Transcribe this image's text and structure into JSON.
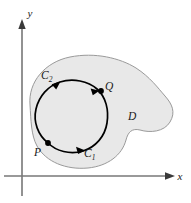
{
  "figure": {
    "background_color": "#ffffff",
    "region": {
      "label": "D",
      "fill_color": "#e8e8e8",
      "stroke_color": "#9a9a9a",
      "label_x": 128,
      "label_y": 119
    },
    "axes": {
      "color": "#777777",
      "x_label": "x",
      "y_label": "y",
      "x_label_pos": {
        "x": 178,
        "y": 180
      },
      "y_label_pos": {
        "x": 30,
        "y": 17
      },
      "origin": {
        "x": 22,
        "y": 176
      }
    },
    "curve": {
      "stroke_color": "#000000",
      "stroke_width": 1.6
    },
    "points": [
      {
        "name": "P",
        "label": "P",
        "x": 48,
        "y": 143,
        "label_x": 36,
        "label_y": 155
      },
      {
        "name": "Q",
        "label": "Q",
        "x": 101,
        "y": 91,
        "label_x": 104,
        "label_y": 89
      }
    ],
    "curve_labels": [
      {
        "name": "C1",
        "base": "C",
        "sub": "1",
        "x": 87,
        "y": 155
      },
      {
        "name": "C2",
        "base": "C",
        "sub": "2",
        "x": 44,
        "y": 78
      }
    ],
    "arrows": [
      {
        "name": "arrow-upper-left",
        "direction": "up-right"
      },
      {
        "name": "arrow-near-q",
        "direction": "up-right"
      },
      {
        "name": "arrow-bottom",
        "direction": "right"
      }
    ]
  }
}
